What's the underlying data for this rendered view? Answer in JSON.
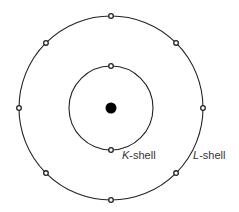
{
  "diagram": {
    "type": "bohr-atom-model",
    "center": {
      "x": 111,
      "y": 108
    },
    "nucleus": {
      "radius": 5.5,
      "color": "#000000"
    },
    "shells": [
      {
        "name": "K",
        "label_letter": "K",
        "label_suffix": "-shell",
        "radius": 42,
        "electron_count": 2,
        "label_pos": {
          "x": 122,
          "y": 159
        }
      },
      {
        "name": "L",
        "label_letter": "L",
        "label_suffix": "-shell",
        "radius": 92,
        "electron_count": 8,
        "label_pos": {
          "x": 193,
          "y": 159
        }
      }
    ],
    "colors": {
      "line": "#222222",
      "text": "#333333",
      "background": "#ffffff"
    }
  }
}
